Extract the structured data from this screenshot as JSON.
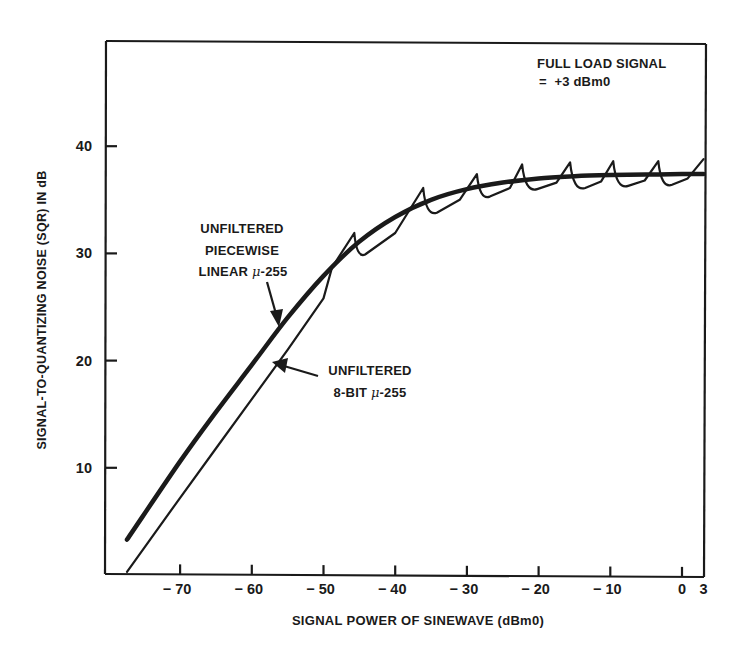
{
  "chart_data": {
    "type": "line",
    "title": "",
    "xlabel": "SIGNAL POWER OF SINEWAVE (dBm0)",
    "ylabel": "SIGNAL-TO-QUANTIZING NOISE (SQR) IN dB",
    "xlim": [
      -80,
      3
    ],
    "ylim": [
      0,
      50
    ],
    "x_ticks": [
      -70,
      -60,
      -50,
      -40,
      -30,
      -20,
      -10,
      0,
      3
    ],
    "x_tick_labels": [
      "−70",
      "−60",
      "−50",
      "−40",
      "−30",
      "−20",
      "−10",
      "0",
      "3"
    ],
    "y_ticks": [
      10,
      20,
      30,
      40
    ],
    "y_tick_labels": [
      "10",
      "20",
      "30",
      "40"
    ],
    "grid": false,
    "legend": "none (inline annotations with arrows)",
    "annotations": [
      {
        "text": [
          "FULL LOAD SIGNAL",
          "= +3 dBm0"
        ],
        "position": "top-right"
      },
      {
        "text": [
          "UNFILTERED",
          "PIECEWISE",
          "LINEAR μ-255"
        ],
        "points_to": "Unfiltered piecewise linear μ-255"
      },
      {
        "text": [
          "UNFILTERED",
          "8-BIT μ-255"
        ],
        "points_to": "Unfiltered 8-bit μ-255"
      }
    ],
    "series": [
      {
        "name": "Unfiltered piecewise linear μ-255",
        "style": "thick smooth line",
        "x": [
          -77.4,
          -70,
          -65,
          -60,
          -55,
          -50,
          -45,
          -40,
          -35,
          -30,
          -25,
          -20,
          -15,
          -10,
          -5,
          0,
          3
        ],
        "y": [
          3.3,
          10.6,
          15.2,
          19.6,
          24.0,
          27.9,
          31.1,
          33.4,
          35.0,
          36.0,
          36.6,
          37.0,
          37.2,
          37.3,
          37.35,
          37.4,
          37.4
        ]
      },
      {
        "name": "Unfiltered 8-bit μ-255",
        "style": "thin sawtooth line",
        "x": [
          -77.4,
          -70,
          -65,
          -60,
          -55,
          -50,
          -48.8,
          -45.7,
          -44.2,
          -40,
          -36.1,
          -34.2,
          -31,
          -28.6,
          -26.8,
          -24,
          -22.3,
          -20.2,
          -17.5,
          -15.6,
          -13.5,
          -11.3,
          -9.6,
          -7.5,
          -5.2,
          -3.3,
          -1.4,
          0.8,
          3
        ],
        "y": [
          0.3,
          7.2,
          11.8,
          16.4,
          21.0,
          25.8,
          28.7,
          31.9,
          29.9,
          31.9,
          36.1,
          33.8,
          35.0,
          37.4,
          35.3,
          36.1,
          38.3,
          36.0,
          36.6,
          38.5,
          36.1,
          36.7,
          38.6,
          36.3,
          36.8,
          38.6,
          36.4,
          37.0,
          38.8
        ]
      }
    ]
  },
  "labels": {
    "full_load_line1": "FULL LOAD SIGNAL",
    "full_load_line2": "=  +3 dBm0",
    "piecewise_line1": "UNFILTERED",
    "piecewise_line2": "PIECEWISE",
    "piecewise_line3_prefix": "LINEAR ",
    "piecewise_line3_mu": "μ",
    "piecewise_line3_suffix": "-255",
    "eightbit_line1": "UNFILTERED",
    "eightbit_line2_prefix": "8-BIT ",
    "eightbit_line2_mu": "μ",
    "eightbit_line2_suffix": "-255"
  },
  "colors": {
    "ink": "#1a1a1a",
    "background": "#ffffff"
  }
}
